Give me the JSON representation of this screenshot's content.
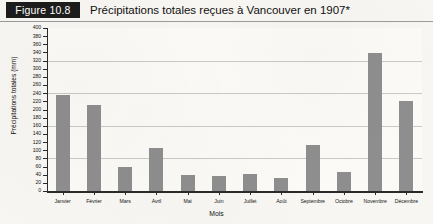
{
  "figure": {
    "badge_label": "Figure 10.8",
    "title": "Précipitations totales reçues à Vancouver en 1907*"
  },
  "colors": {
    "bar": "#8e8e8e",
    "badge_background": "#1c1c1c",
    "badge_text": "#ffffff",
    "axis": "#2a2a2a",
    "gridline": "#c9c9c9",
    "page_background": "#f7f6f2"
  },
  "chart_data": {
    "type": "bar",
    "title": "Précipitations totales reçues à Vancouver en 1907*",
    "xlabel": "Mois",
    "ylabel": "Précipitations totales (mm)",
    "categories": [
      "Janvier",
      "Février",
      "Mars",
      "Avril",
      "Mai",
      "Juin",
      "Juillet",
      "Août",
      "Septembre",
      "Octobre",
      "Novembre",
      "Décembre"
    ],
    "values": [
      235,
      212,
      60,
      105,
      40,
      38,
      42,
      33,
      113,
      47,
      338,
      222
    ],
    "ylim": [
      0,
      400
    ],
    "ytick_step": 20,
    "yticks": [
      0,
      20,
      40,
      60,
      80,
      100,
      120,
      140,
      160,
      180,
      200,
      220,
      240,
      260,
      280,
      300,
      320,
      340,
      360,
      380,
      400
    ],
    "ytick_labels": [
      "0",
      "20",
      "40",
      "60",
      "80",
      "100",
      "120",
      "140",
      "160",
      "180",
      "200",
      "220",
      "240",
      "260",
      "280",
      "300",
      "320",
      "340",
      "360",
      "380",
      "400"
    ],
    "gridlines": [
      80,
      160,
      240,
      320
    ],
    "grid": true,
    "legend": null,
    "legend_position": "none",
    "series": [
      {
        "name": "Précipitations totales (mm)",
        "values": [
          235,
          212,
          60,
          105,
          40,
          38,
          42,
          33,
          113,
          47,
          338,
          222
        ]
      }
    ]
  }
}
